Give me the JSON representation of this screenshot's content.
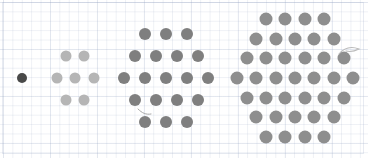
{
  "figure": {
    "background": {
      "name": "graph-paper",
      "paper_color": "#ffffff",
      "grid_line_color": "#96a5c3",
      "minor_cell_px": 9.4,
      "major_cell_px": 47
    },
    "canvas": {
      "width": 368,
      "height": 158
    },
    "sequence_name": "centered hexagonal numbers",
    "counts": [
      1,
      7,
      19,
      37
    ],
    "groups": [
      {
        "id": "group-1",
        "label": "1",
        "dot_count": 1,
        "rows": [
          1
        ],
        "color": "#494949",
        "dot_diameter": 10,
        "center_x": 22,
        "center_y": 78,
        "spacing_x": 18.5,
        "spacing_y": 17
      },
      {
        "id": "group-2",
        "label": "7",
        "dot_count": 7,
        "rows": [
          2,
          3,
          2
        ],
        "color": "#b5b5b5",
        "dot_diameter": 11,
        "center_x": 75,
        "center_y": 78,
        "spacing_x": 18.5,
        "spacing_y": 22
      },
      {
        "id": "group-3",
        "label": "19",
        "dot_count": 19,
        "rows": [
          3,
          4,
          5,
          4,
          3
        ],
        "color": "#7f7f7f",
        "dot_diameter": 12,
        "center_x": 166,
        "center_y": 78,
        "spacing_x": 21,
        "spacing_y": 22
      },
      {
        "id": "group-4",
        "label": "37",
        "dot_count": 37,
        "rows": [
          4,
          5,
          6,
          7,
          6,
          5,
          4
        ],
        "color": "#8e8e8e",
        "dot_diameter": 13,
        "center_x": 295,
        "center_y": 78,
        "spacing_x": 19.4,
        "spacing_y": 19.6
      }
    ],
    "marks": [
      {
        "name": "pencil-squiggle-upper-right",
        "x": 349,
        "y": 51
      },
      {
        "name": "pencil-squiggle-lower-left",
        "x": 145,
        "y": 113
      }
    ]
  }
}
